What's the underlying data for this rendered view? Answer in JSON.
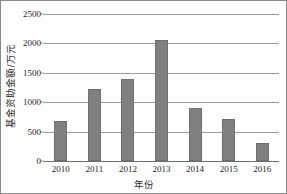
{
  "chart_data": {
    "type": "bar",
    "title": "",
    "xlabel": "年份",
    "ylabel": "基金资助金额/万元",
    "categories": [
      "2010",
      "2011",
      "2012",
      "2013",
      "2014",
      "2015",
      "2016"
    ],
    "values": [
      680,
      1230,
      1400,
      2050,
      910,
      720,
      300
    ],
    "series": [
      {
        "name": "基金资助金额",
        "values": [
          680,
          1230,
          1400,
          2050,
          910,
          720,
          300
        ]
      }
    ],
    "ylim": [
      0,
      2500
    ],
    "yticks": [
      0,
      500,
      1000,
      1500,
      2000,
      2500
    ],
    "ytick_labels": [
      "0",
      "500",
      "1000",
      "1500",
      "2000",
      "2500"
    ],
    "grid": true,
    "grid_axis": "y",
    "legend": false,
    "legend_position": "none",
    "bar_color": "#808080",
    "bar_edge_color": "#6f6f6f",
    "grid_color": "#9a9a9a",
    "axis_color": "#6e6e6e",
    "text_color": "#1d1d1d",
    "frame_color": "#8a8a8a",
    "background": "#ffffff"
  }
}
